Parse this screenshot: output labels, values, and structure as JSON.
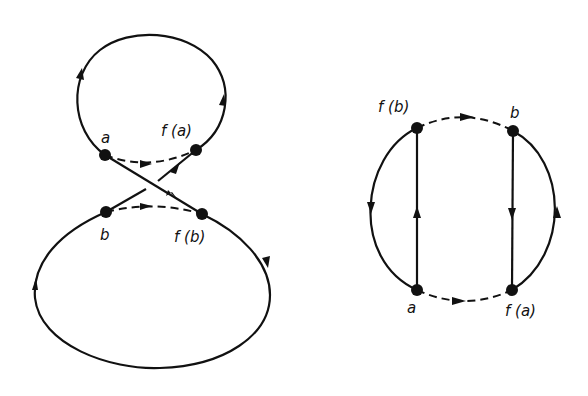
{
  "figure": {
    "left_diagram": {
      "description": "Two loops joined by crossing arcs (figure-eight style)",
      "nodes": [
        {
          "id": "a",
          "label": "a"
        },
        {
          "id": "fa",
          "label": "f (a)"
        },
        {
          "id": "b",
          "label": "b"
        },
        {
          "id": "fb",
          "label": "f (b)"
        }
      ],
      "edges": [
        {
          "from": "a",
          "to": "fa",
          "style": "dashed",
          "arrow": "right"
        },
        {
          "from": "b",
          "to": "fb",
          "style": "dashed",
          "arrow": "right"
        },
        {
          "from": "a",
          "to": "fb",
          "style": "solid",
          "arrow": "down-right"
        },
        {
          "from": "b",
          "to": "fa",
          "style": "solid",
          "arrow": "up-right"
        },
        {
          "loop": "top",
          "direction": "counterclockwise-through-top"
        },
        {
          "loop": "bottom",
          "direction": "clockwise-through-bottom"
        }
      ]
    },
    "right_diagram": {
      "description": "Circle with two vertical chords",
      "nodes": [
        {
          "id": "fb",
          "label": "f (b)"
        },
        {
          "id": "b",
          "label": "b"
        },
        {
          "id": "a",
          "label": "a"
        },
        {
          "id": "fa",
          "label": "f (a)"
        }
      ],
      "edges": [
        {
          "from": "fb",
          "to": "b",
          "style": "dashed",
          "arrow": "right"
        },
        {
          "from": "a",
          "to": "fa",
          "style": "dashed",
          "arrow": "right"
        },
        {
          "from": "a",
          "to": "fb",
          "style": "solid",
          "arrow": "up"
        },
        {
          "from": "b",
          "to": "fa",
          "style": "solid",
          "arrow": "down"
        },
        {
          "arc": "left",
          "arrow": "down"
        },
        {
          "arc": "right",
          "arrow": "up"
        }
      ]
    }
  },
  "labels": {
    "left_a": "a",
    "left_fa": "f (a)",
    "left_b": "b",
    "left_fb": "f (b)",
    "right_fb": "f (b)",
    "right_b": "b",
    "right_a": "a",
    "right_fa": "f (a)"
  },
  "colors": {
    "ink": "#111111",
    "background": "#ffffff"
  }
}
